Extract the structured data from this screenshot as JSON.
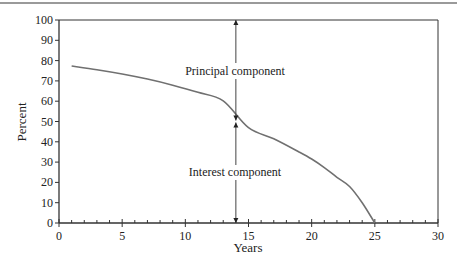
{
  "chart_data": {
    "type": "line",
    "title": "",
    "xlabel": "Years",
    "ylabel": "Percent",
    "xlim": [
      0,
      30
    ],
    "ylim": [
      0,
      100
    ],
    "xticks": [
      0,
      5,
      10,
      15,
      20,
      25,
      30
    ],
    "yticks": [
      0,
      10,
      20,
      30,
      40,
      50,
      60,
      70,
      80,
      90,
      100
    ],
    "grid": false,
    "legend": null,
    "series": [
      {
        "name": "Interest share of payment",
        "x": [
          1,
          3,
          5,
          7,
          9,
          11,
          13,
          14,
          15,
          17,
          19,
          20,
          21,
          22,
          23,
          24,
          25
        ],
        "values": [
          77.3,
          75.5,
          73.4,
          70.9,
          67.9,
          64.4,
          60.2,
          50.2,
          47.0,
          41.5,
          35.0,
          31.5,
          27.3,
          22.5,
          18.0,
          10.0,
          0
        ]
      }
    ],
    "annotations": [
      {
        "text": "Principal component",
        "x": 14,
        "y_range": [
          50,
          100
        ]
      },
      {
        "text": "Interest component",
        "x": 14,
        "y_range": [
          0,
          50
        ]
      }
    ]
  },
  "labels": {
    "xlabel": "Years",
    "ylabel": "Percent",
    "principal": "Principal component",
    "interest": "Interest component"
  },
  "colors": {
    "curve": "#707070",
    "axis": "#333333",
    "text": "#222222"
  }
}
